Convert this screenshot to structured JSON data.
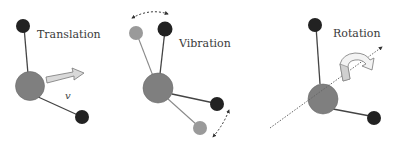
{
  "diagram": {
    "colors": {
      "heavy_atom": "#7f7f7f",
      "light_atom": "#222222",
      "displaced_atom": "#9a9a9a",
      "bond": "#444444",
      "displaced_bond": "#8a8a8a",
      "arrow_fill": "#d9d9d9",
      "arrow_stroke": "#777777"
    },
    "panels": [
      {
        "id": "translation",
        "label": "Translation",
        "velocity_symbol": "v"
      },
      {
        "id": "vibration",
        "label": "Vibration"
      },
      {
        "id": "rotation",
        "label": "Rotation"
      }
    ]
  }
}
